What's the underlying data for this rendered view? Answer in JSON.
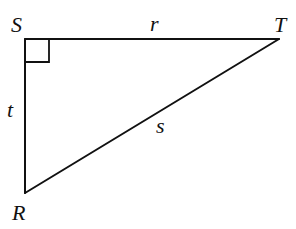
{
  "diagram": {
    "type": "right-triangle",
    "stroke_color": "#111111",
    "background": "#ffffff",
    "vertices": {
      "S": {
        "label": "S",
        "x": 25,
        "y": 39
      },
      "T": {
        "label": "T",
        "x": 279,
        "y": 39
      },
      "R": {
        "label": "R",
        "x": 25,
        "y": 193
      }
    },
    "sides": {
      "r": {
        "label": "r",
        "from": "S",
        "to": "T"
      },
      "t": {
        "label": "t",
        "from": "S",
        "to": "R"
      },
      "s": {
        "label": "s",
        "from": "R",
        "to": "T"
      }
    },
    "right_angle_at": "S",
    "right_angle_marker_size": 24
  }
}
